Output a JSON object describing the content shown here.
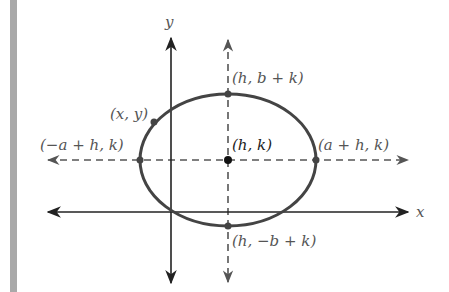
{
  "diagram": {
    "axes": {
      "x_label": "x",
      "y_label": "y"
    },
    "points": {
      "top": "(h, b + k)",
      "bottom": "(h, −b + k)",
      "left": "(−a + h, k)",
      "right": "(a + h, k)",
      "center": "(h, k)",
      "general": "(x, y)"
    },
    "colors": {
      "curve": "#444444",
      "axis": "#222222",
      "dashed": "#555555",
      "label": "#555555",
      "side_bar": "#a9a9a9"
    }
  }
}
